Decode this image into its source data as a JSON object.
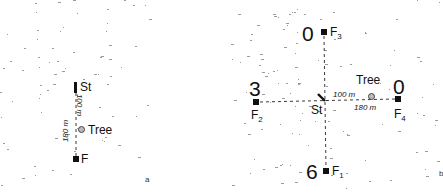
{
  "figure": {
    "panel_a": {
      "letter": "a",
      "start_label": "St",
      "tree_label": "Tree",
      "feeder_label": "F",
      "distance_start_tree": "100 m",
      "distance_start_feeder": "180 m"
    },
    "panel_b": {
      "letter": "b",
      "start_label": "St",
      "tree_label": "Tree",
      "distance_start_tree": "100 m",
      "distance_start_feeder": "180 m",
      "feeders": [
        {
          "id": "F1",
          "name": "F",
          "sub": "1",
          "count": "6",
          "direction": "south"
        },
        {
          "id": "F2",
          "name": "F",
          "sub": "2",
          "count": "3",
          "direction": "west"
        },
        {
          "id": "F3",
          "name": "F",
          "sub": "3",
          "count": "0",
          "direction": "north"
        },
        {
          "id": "F4",
          "name": "F",
          "sub": "4",
          "count": "0",
          "direction": "east"
        }
      ]
    },
    "colors": {
      "ink": "#111111",
      "speckle": "#9a9a9a",
      "background": "#ffffff"
    }
  }
}
